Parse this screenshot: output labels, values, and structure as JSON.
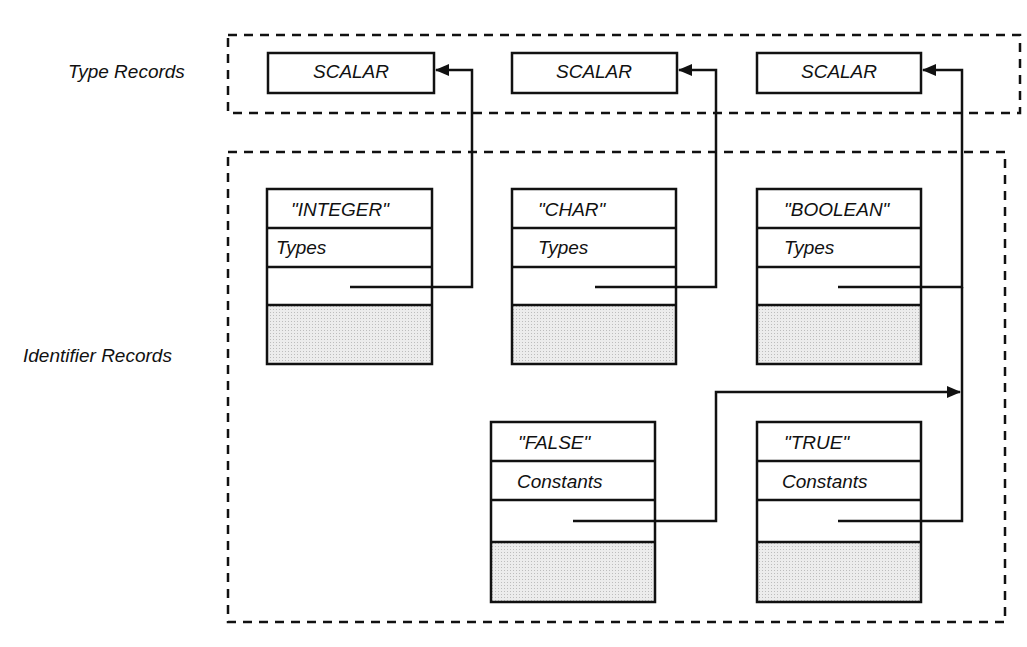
{
  "regions": {
    "type_records": {
      "label": "Type Records"
    },
    "identifier_records": {
      "label": "Identifier Records"
    }
  },
  "type_records": [
    {
      "id": "scalar-1",
      "label": "SCALAR"
    },
    {
      "id": "scalar-2",
      "label": "SCALAR"
    },
    {
      "id": "scalar-3",
      "label": "SCALAR"
    }
  ],
  "identifier_records": [
    {
      "id": "integer",
      "name": "\"INTEGER\"",
      "kind": "Types",
      "points_to": "scalar-1"
    },
    {
      "id": "char",
      "name": "\"CHAR\"",
      "kind": "Types",
      "points_to": "scalar-2"
    },
    {
      "id": "boolean",
      "name": "\"BOOLEAN\"",
      "kind": "Types",
      "points_to": "scalar-3"
    },
    {
      "id": "false",
      "name": "\"FALSE\"",
      "kind": "Constants",
      "points_to": "boolean-type-link"
    },
    {
      "id": "true",
      "name": "\"TRUE\"",
      "kind": "Constants",
      "points_to": "scalar-3"
    }
  ],
  "colors": {
    "stroke": "#111111",
    "shade": "#e2e2e2",
    "background": "#ffffff"
  }
}
